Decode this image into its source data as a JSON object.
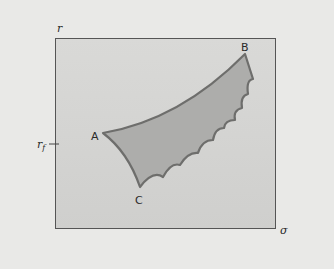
{
  "diagram": {
    "type": "feasible-set-diagram",
    "y_axis_label": "r",
    "x_axis_label": "σ",
    "risk_free_tick_label": "r",
    "risk_free_tick_subscript": "f",
    "points": [
      {
        "id": "A",
        "label": "A"
      },
      {
        "id": "B",
        "label": "B"
      },
      {
        "id": "C",
        "label": "C"
      }
    ],
    "colors": {
      "background": "#e9e9e7",
      "plot_area": "#d4d4d2",
      "region_fill": "#adadab",
      "region_stroke": "#6e6e6c",
      "axis": "#555555"
    }
  }
}
